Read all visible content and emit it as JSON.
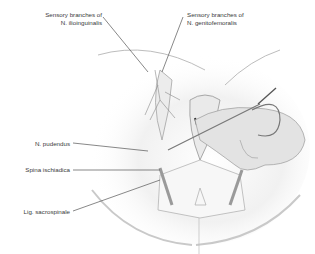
{
  "figure": {
    "labels": {
      "ilioinguinal_line1": "Sensory branches of",
      "ilioinguinal_line2": "N. ilioinguinalis",
      "genitofemoral_line1": "Sensory branches of",
      "genitofemoral_line2": "N. genitofemoralis",
      "pudendus": "N. pudendus",
      "spina": "Spina ischiadica",
      "sacrospinale": "Lig. sacrospinale"
    },
    "colors": {
      "line": "#555555",
      "skin_shade": "#d8d8d8",
      "text": "#3a3a3a"
    }
  }
}
